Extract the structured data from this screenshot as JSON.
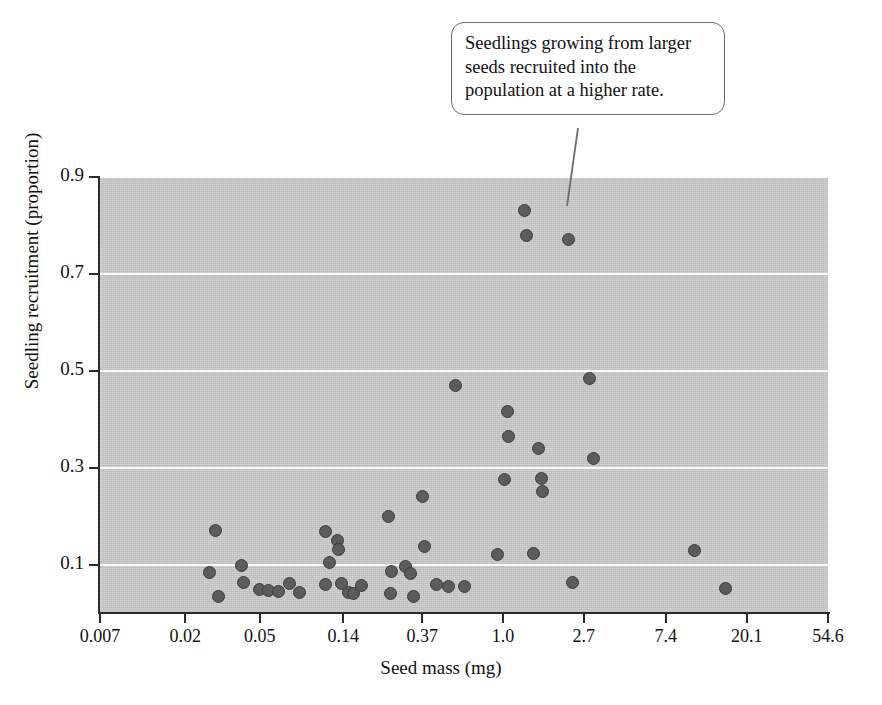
{
  "figure": {
    "background_color": "#ffffff",
    "plot_background_color": "#c7c7c7",
    "gridline_color": "#fbfbfb",
    "point_fill_color": "#5c5c5c",
    "point_edge_color": "#3c3c3c",
    "axis_color": "#2b2b2b"
  },
  "annotation": {
    "text": "Seedlings growing from larger seeds recruited into the population at a higher rate.",
    "target_x": 1.35,
    "target_y": 0.83
  },
  "chart_data": {
    "type": "scatter",
    "title": "",
    "xlabel": "Seed mass (mg)",
    "ylabel": "Seedling recruitment (proportion)",
    "xscale": "log",
    "yscale": "linear",
    "grid": true,
    "legend": null,
    "xticks": [
      0.007,
      0.02,
      0.05,
      0.14,
      0.37,
      1.0,
      2.7,
      7.4,
      20.1,
      54.6
    ],
    "xtick_labels": [
      "0.007",
      "0.02",
      "0.05",
      "0.14",
      "0.37",
      "1.0",
      "2.7",
      "7.4",
      "20.1",
      "54.6"
    ],
    "yticks": [
      0.1,
      0.3,
      0.5,
      0.7,
      0.9
    ],
    "ytick_labels": [
      "0.1",
      "0.3",
      "0.5",
      "0.7",
      "0.9"
    ],
    "xlim": [
      0.007,
      54.6
    ],
    "ylim": [
      0.0,
      0.9
    ],
    "series": [
      {
        "name": "Seedling recruitment vs seed mass",
        "points": [
          {
            "x": 0.029,
            "y": 0.17
          },
          {
            "x": 0.027,
            "y": 0.083
          },
          {
            "x": 0.03,
            "y": 0.035
          },
          {
            "x": 0.04,
            "y": 0.098
          },
          {
            "x": 0.041,
            "y": 0.062
          },
          {
            "x": 0.05,
            "y": 0.048
          },
          {
            "x": 0.056,
            "y": 0.046
          },
          {
            "x": 0.063,
            "y": 0.045
          },
          {
            "x": 0.072,
            "y": 0.06
          },
          {
            "x": 0.082,
            "y": 0.043
          },
          {
            "x": 0.112,
            "y": 0.168
          },
          {
            "x": 0.131,
            "y": 0.15
          },
          {
            "x": 0.132,
            "y": 0.132
          },
          {
            "x": 0.118,
            "y": 0.104
          },
          {
            "x": 0.113,
            "y": 0.058
          },
          {
            "x": 0.137,
            "y": 0.06
          },
          {
            "x": 0.15,
            "y": 0.042
          },
          {
            "x": 0.158,
            "y": 0.04
          },
          {
            "x": 0.175,
            "y": 0.057
          },
          {
            "x": 0.243,
            "y": 0.2
          },
          {
            "x": 0.253,
            "y": 0.085
          },
          {
            "x": 0.25,
            "y": 0.04
          },
          {
            "x": 0.3,
            "y": 0.095
          },
          {
            "x": 0.32,
            "y": 0.082
          },
          {
            "x": 0.33,
            "y": 0.034
          },
          {
            "x": 0.37,
            "y": 0.24
          },
          {
            "x": 0.38,
            "y": 0.138
          },
          {
            "x": 0.44,
            "y": 0.058
          },
          {
            "x": 0.51,
            "y": 0.055
          },
          {
            "x": 0.56,
            "y": 0.47
          },
          {
            "x": 0.62,
            "y": 0.055
          },
          {
            "x": 0.93,
            "y": 0.12
          },
          {
            "x": 1.05,
            "y": 0.415
          },
          {
            "x": 1.07,
            "y": 0.365
          },
          {
            "x": 1.02,
            "y": 0.275
          },
          {
            "x": 1.3,
            "y": 0.83
          },
          {
            "x": 1.33,
            "y": 0.78
          },
          {
            "x": 1.55,
            "y": 0.34
          },
          {
            "x": 1.6,
            "y": 0.278
          },
          {
            "x": 1.62,
            "y": 0.25
          },
          {
            "x": 1.45,
            "y": 0.122
          },
          {
            "x": 2.25,
            "y": 0.77
          },
          {
            "x": 2.9,
            "y": 0.485
          },
          {
            "x": 3.05,
            "y": 0.318
          },
          {
            "x": 2.35,
            "y": 0.062
          },
          {
            "x": 10.5,
            "y": 0.128
          },
          {
            "x": 15.5,
            "y": 0.05
          }
        ]
      }
    ]
  }
}
